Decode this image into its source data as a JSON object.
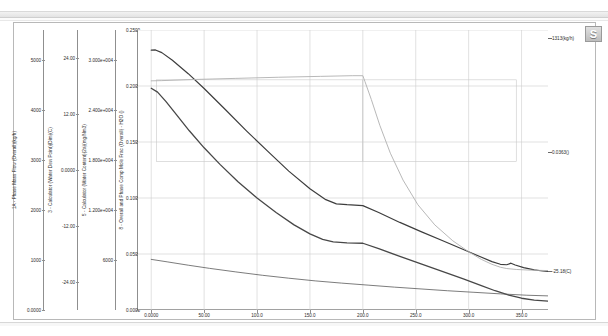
{
  "window": {
    "corner_icon": "s-logo-icon"
  },
  "chart_data": {
    "type": "line",
    "title": "",
    "xlabel": "Hours",
    "grid": true,
    "legend_position": "none",
    "xlim": [
      -12.5,
      375.0
    ],
    "xticks": [
      "0.0000",
      "50.00",
      "100.0",
      "150.0",
      "200.0",
      "250.0",
      "300.0",
      "350.0"
    ],
    "xtick_values": [
      0,
      50,
      100,
      150,
      200,
      250,
      300,
      350
    ],
    "axes": [
      {
        "id": "axis-1",
        "label": "1A - Phase Mass Flow (Overall)(kg/h)",
        "unit": "kg/h",
        "ticks": [
          "5000",
          "4000",
          "3000",
          "2000",
          "1000",
          "0.0000"
        ],
        "tick_values": [
          5000,
          4000,
          3000,
          2000,
          1000,
          0
        ],
        "ylim": [
          0,
          5600
        ]
      },
      {
        "id": "axis-2",
        "label": "3 - Calculator (Water Dew Point)(Dim)(C)",
        "unit": "C",
        "ticks": [
          "24.00",
          "12.00",
          "0.0000",
          "-12.00",
          "-24.00"
        ],
        "tick_values": [
          24,
          12,
          0,
          -12,
          -24
        ],
        "ylim": [
          -30,
          30
        ]
      },
      {
        "id": "axis-3",
        "label": "5 - Calculator (Water Content)(2a)(mg/Nm3)",
        "unit": "mg/Nm3",
        "ticks": [
          "3.000e+004",
          "2.400e+004",
          "1.800e+004",
          "1.200e+004",
          "6000"
        ],
        "tick_values": [
          30000,
          24000,
          18000,
          12000,
          6000
        ],
        "ylim": [
          0,
          33600
        ]
      },
      {
        "id": "axis-4",
        "label": "8 - Overall and Phase Comp Mole Frac (Overall) - H2O ()",
        "unit": "",
        "ticks": [
          "0.2500",
          "0.2000",
          "0.1500",
          "0.1000",
          "0.0500",
          "0.0000"
        ],
        "tick_values": [
          0.25,
          0.2,
          0.15,
          0.1,
          0.05,
          0.0
        ],
        "ylim": [
          0.0,
          0.25
        ]
      }
    ],
    "series": [
      {
        "name": "phase-mass-flow",
        "axis": "axis-1",
        "color": "#3d3d3d",
        "width": 1.2,
        "end_label": "1313(kg/h)",
        "points": [
          [
            0,
            0.232
          ],
          [
            4,
            0.2322
          ],
          [
            10,
            0.2298
          ],
          [
            20,
            0.223
          ],
          [
            35,
            0.211
          ],
          [
            50,
            0.1978
          ],
          [
            70,
            0.179
          ],
          [
            90,
            0.16
          ],
          [
            110,
            0.1418
          ],
          [
            130,
            0.124
          ],
          [
            150,
            0.1082
          ],
          [
            165,
            0.0985
          ],
          [
            175,
            0.0948
          ],
          [
            185,
            0.094
          ],
          [
            200,
            0.0932
          ],
          [
            215,
            0.087
          ],
          [
            235,
            0.0782
          ],
          [
            255,
            0.07
          ],
          [
            275,
            0.062
          ],
          [
            295,
            0.054
          ],
          [
            310,
            0.048
          ],
          [
            322,
            0.0432
          ],
          [
            330,
            0.0408
          ],
          [
            336,
            0.0404
          ],
          [
            340,
            0.0418
          ],
          [
            344,
            0.0402
          ],
          [
            352,
            0.0378
          ],
          [
            362,
            0.0358
          ],
          [
            370,
            0.0348
          ],
          [
            375,
            0.0345
          ]
        ]
      },
      {
        "name": "water-content",
        "axis": "axis-3",
        "color": "#474747",
        "width": 1.3,
        "end_label": "596(mg/Nm3)",
        "points": [
          [
            0,
            0.198
          ],
          [
            6,
            0.1945
          ],
          [
            14,
            0.186
          ],
          [
            24,
            0.1742
          ],
          [
            36,
            0.16
          ],
          [
            50,
            0.1448
          ],
          [
            65,
            0.13
          ],
          [
            82,
            0.1145
          ],
          [
            100,
            0.1
          ],
          [
            118,
            0.087
          ],
          [
            135,
            0.076
          ],
          [
            150,
            0.068
          ],
          [
            162,
            0.063
          ],
          [
            172,
            0.0608
          ],
          [
            185,
            0.06
          ],
          [
            200,
            0.0596
          ],
          [
            215,
            0.0548
          ],
          [
            235,
            0.0478
          ],
          [
            255,
            0.0412
          ],
          [
            275,
            0.0345
          ],
          [
            295,
            0.0278
          ],
          [
            312,
            0.0218
          ],
          [
            325,
            0.0172
          ],
          [
            338,
            0.0132
          ],
          [
            350,
            0.0105
          ],
          [
            362,
            0.0088
          ],
          [
            375,
            0.008
          ]
        ]
      },
      {
        "name": "water-dew-point",
        "axis": "axis-2",
        "color": "#b0b0b0",
        "width": 0.9,
        "end_label": "0.0363()",
        "points": [
          [
            0,
            0.2046
          ],
          [
            10,
            0.2048
          ],
          [
            40,
            0.2058
          ],
          [
            80,
            0.2068
          ],
          [
            120,
            0.2078
          ],
          [
            160,
            0.2086
          ],
          [
            190,
            0.2092
          ],
          [
            200,
            0.2092
          ],
          [
            202,
            0.204
          ],
          [
            208,
            0.188
          ],
          [
            216,
            0.165
          ],
          [
            226,
            0.14
          ],
          [
            238,
            0.116
          ],
          [
            252,
            0.094
          ],
          [
            268,
            0.076
          ],
          [
            285,
            0.0618
          ],
          [
            300,
            0.052
          ],
          [
            312,
            0.0452
          ],
          [
            322,
            0.0408
          ],
          [
            330,
            0.0382
          ],
          [
            336,
            0.037
          ],
          [
            345,
            0.0362
          ],
          [
            358,
            0.0356
          ],
          [
            375,
            0.0352
          ]
        ]
      },
      {
        "name": "h2o-mole-frac",
        "axis": "axis-4",
        "color": "#5a5a5a",
        "width": 0.8,
        "end_label": "0.0697()",
        "points": [
          [
            0,
            0.0452
          ],
          [
            15,
            0.043
          ],
          [
            35,
            0.04
          ],
          [
            55,
            0.0372
          ],
          [
            80,
            0.034
          ],
          [
            105,
            0.031
          ],
          [
            130,
            0.0284
          ],
          [
            155,
            0.026
          ],
          [
            180,
            0.024
          ],
          [
            205,
            0.0222
          ],
          [
            230,
            0.0204
          ],
          [
            255,
            0.0188
          ],
          [
            280,
            0.0172
          ],
          [
            305,
            0.0158
          ],
          [
            330,
            0.0144
          ],
          [
            355,
            0.0132
          ],
          [
            375,
            0.0126
          ]
        ]
      }
    ],
    "rect_overlays": [
      {
        "name": "overlay-box-1",
        "x0": 5,
        "x1": 200,
        "y0": 0.1325,
        "y1": 0.2055,
        "color": "#c9c9c9"
      },
      {
        "name": "overlay-box-2",
        "x0": 200,
        "x1": 345,
        "y0": 0.1325,
        "y1": 0.2055,
        "color": "#c9c9c9"
      }
    ],
    "annotations": [
      {
        "name": "annot-mass-flow",
        "text": "1313(kg/h)",
        "y_frac": 0.243
      },
      {
        "name": "annot-dew-point",
        "text": "0.0363()",
        "y_frac": 0.141
      },
      {
        "name": "annot-water-temp",
        "text": "-25.18(C)",
        "y_frac": 0.035
      },
      {
        "name": "annot-water-content",
        "text": "(596(mg/Nm3)",
        "y_frac": -0.03
      },
      {
        "name": "annot-mole-frac",
        "text": "0.0697()",
        "y_frac": -0.062
      }
    ]
  }
}
